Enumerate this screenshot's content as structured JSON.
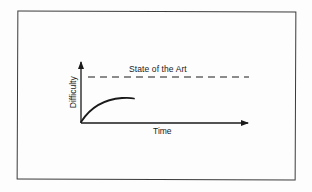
{
  "diagram": {
    "type": "conceptual-line-graph",
    "x_axis": {
      "label": "Time",
      "arrow": true
    },
    "y_axis": {
      "label": "Difficulty",
      "arrow": true
    },
    "reference_line": {
      "label": "State of the Art",
      "style": "dashed"
    },
    "curve": {
      "shape": "concave-rising-then-plateau",
      "description": "Difficulty rises quickly from origin then levels off below the State of the Art line"
    },
    "colors": {
      "ink": "#1a1a1a",
      "frame": "#3a3a3a",
      "background": "#fdfdfd"
    }
  }
}
